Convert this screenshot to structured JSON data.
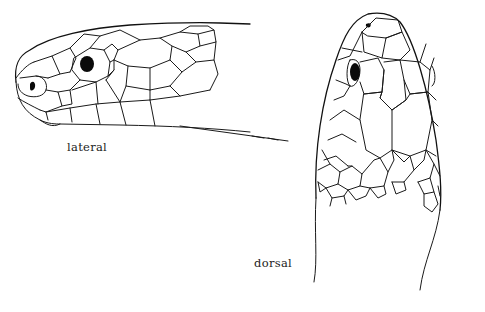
{
  "figure": {
    "views": [
      {
        "id": "lateral",
        "label": "lateral"
      },
      {
        "id": "dorsal",
        "label": "dorsal"
      }
    ],
    "colors": {
      "line": "#1a1a1a",
      "background": "#ffffff",
      "fill": "#0a0a0a"
    }
  },
  "labels": {
    "lateral": "lateral",
    "dorsal": "dorsal"
  }
}
